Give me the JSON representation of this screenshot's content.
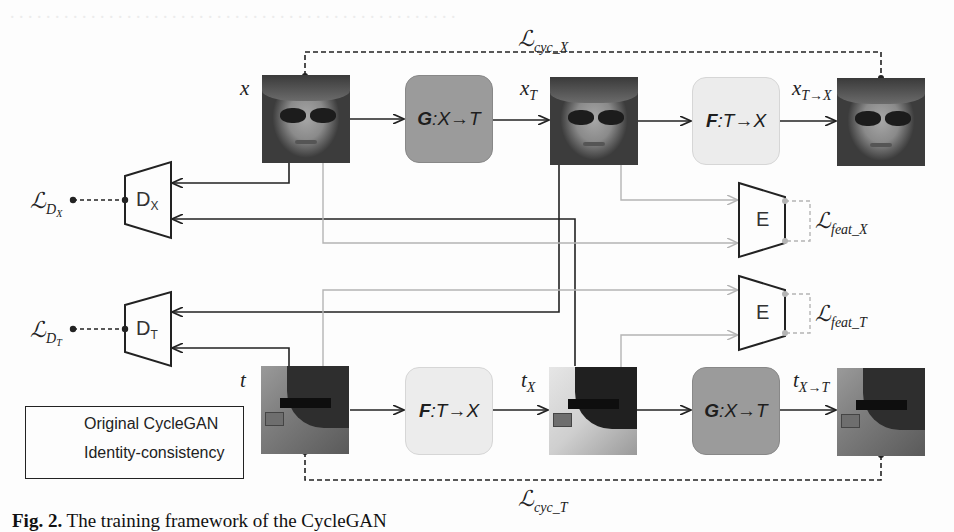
{
  "figure": {
    "caption_prefix": "Fig. 2.",
    "caption_text": "The training framework of the CycleGAN",
    "ghost_text_top": "bleed-through text from previous page (illegible)"
  },
  "top_row": {
    "input_label": "x",
    "translated_label": "x",
    "translated_sub": "T",
    "reconstructed_label": "x",
    "reconstructed_sub": "T→X",
    "generator_G": {
      "name": "G",
      "mapping": ":X→T"
    },
    "generator_F": {
      "name": "F",
      "mapping": ":T→X"
    },
    "cycle_loss": {
      "symbol": "ℒ",
      "sub": "cyc_X"
    }
  },
  "bottom_row": {
    "input_label": "t",
    "translated_label": "t",
    "translated_sub": "X",
    "reconstructed_label": "t",
    "reconstructed_sub": "X→T",
    "generator_F": {
      "name": "F",
      "mapping": ":T→X"
    },
    "generator_G": {
      "name": "G",
      "mapping": ":X→T"
    },
    "cycle_loss": {
      "symbol": "ℒ",
      "sub": "cyc_T"
    }
  },
  "discriminators": [
    {
      "name": "D",
      "sub": "X",
      "loss_symbol": "ℒ",
      "loss_sub": "D",
      "loss_subsub": "X"
    },
    {
      "name": "D",
      "sub": "T",
      "loss_symbol": "ℒ",
      "loss_sub": "D",
      "loss_subsub": "T"
    }
  ],
  "encoders": [
    {
      "name": "E",
      "loss_symbol": "ℒ",
      "loss_sub": "feat_X"
    },
    {
      "name": "E",
      "loss_symbol": "ℒ",
      "loss_sub": "feat_T"
    }
  ],
  "legend": {
    "items": [
      {
        "label": "Original CycleGAN",
        "color": "#222222"
      },
      {
        "label": "Identity-consistency",
        "color": "#b4b4b4"
      }
    ]
  },
  "colors": {
    "line_dark": "#222222",
    "line_light": "#b4b4b4",
    "generator_G_fill": "#9b9b9b",
    "generator_F_fill": "#ececec"
  }
}
